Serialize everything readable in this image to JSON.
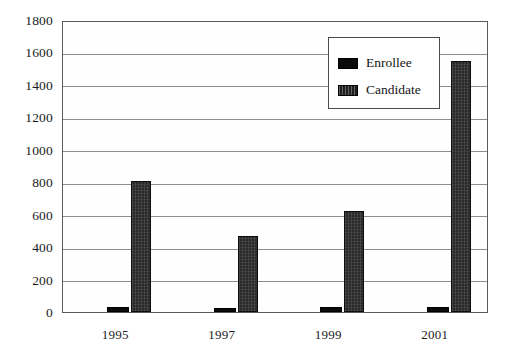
{
  "chart_data": {
    "type": "bar",
    "title": "",
    "subtitle": "",
    "xlabel": "",
    "ylabel": "",
    "categories": [
      "1995",
      "1997",
      "1999",
      "2001"
    ],
    "series": [
      {
        "name": "Enrollee",
        "values": [
          30,
          25,
          28,
          32
        ],
        "color": "#0b0b0b"
      },
      {
        "name": "Candidate",
        "values": [
          810,
          470,
          625,
          1545
        ],
        "color": "#2a2a2a"
      }
    ],
    "ylim": [
      0,
      1800
    ],
    "ytick_step": 200,
    "yticks": [
      "0",
      "200",
      "400",
      "600",
      "800",
      "1000",
      "1200",
      "1400",
      "1600",
      "1800"
    ],
    "grid": true,
    "legend_position": "top-right",
    "legend_entries": [
      "Enrollee",
      "Candidate"
    ]
  },
  "legend": {
    "items": [
      {
        "label": "Enrollee"
      },
      {
        "label": "Candidate"
      }
    ]
  }
}
